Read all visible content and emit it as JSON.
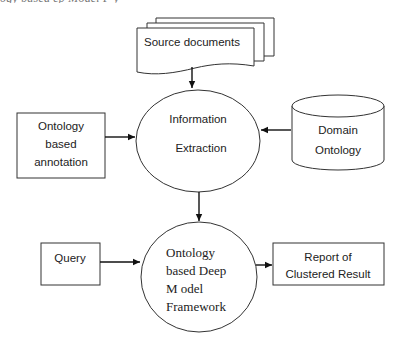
{
  "caption": {
    "text": "ogy  based     ep  Model  F      y"
  },
  "diagram": {
    "nodes": {
      "source_documents": {
        "label": "Source documents",
        "shape": "document-stack"
      },
      "information_extraction": {
        "lines": [
          "Information",
          "Extraction"
        ],
        "shape": "ellipse"
      },
      "ontology_annotation": {
        "lines": [
          "Ontology",
          "based",
          "annotation"
        ],
        "shape": "rectangle"
      },
      "domain_ontology": {
        "lines": [
          "Domain",
          "Ontology"
        ],
        "shape": "cylinder"
      },
      "query": {
        "label": "Query",
        "shape": "rectangle"
      },
      "deep_model_framework": {
        "lines": [
          "Ontology",
          "based Deep",
          "M odel",
          "Framework"
        ],
        "shape": "circle"
      },
      "report": {
        "lines": [
          "Report of",
          "Clustered Result"
        ],
        "shape": "rectangle"
      }
    },
    "edges": [
      {
        "from": "source_documents",
        "to": "information_extraction"
      },
      {
        "from": "ontology_annotation",
        "to": "information_extraction"
      },
      {
        "from": "domain_ontology",
        "to": "information_extraction"
      },
      {
        "from": "information_extraction",
        "to": "deep_model_framework"
      },
      {
        "from": "query",
        "to": "deep_model_framework"
      },
      {
        "from": "deep_model_framework",
        "to": "report"
      }
    ],
    "colors": {
      "stroke": "#333333",
      "arrow": "#111111",
      "text": "#222222",
      "background": "#ffffff"
    }
  }
}
